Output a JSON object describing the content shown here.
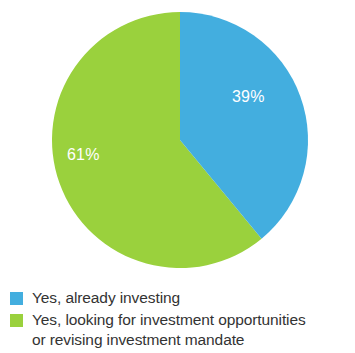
{
  "chart_data": {
    "type": "pie",
    "title": "",
    "subtitle": "",
    "xlabel": "",
    "ylabel": "",
    "grid": false,
    "legend_position": "bottom-left",
    "start_angle_deg": 0,
    "direction": "clockwise",
    "categories": [
      "Yes, already investing",
      "Yes, looking for investment opportunities or revising investment mandate"
    ],
    "values": [
      39,
      61
    ],
    "value_unit": "%",
    "data_labels": [
      "39%",
      "61%"
    ],
    "colors": [
      "#43aedf",
      "#9ad13d"
    ],
    "slices": [
      {
        "label": "Yes, already investing",
        "value": 39,
        "display": "39%",
        "color": "#43aedf",
        "start_deg": 0,
        "end_deg": 140.4
      },
      {
        "label": "Yes, looking for investment opportunities or revising investment mandate",
        "value": 61,
        "display": "61%",
        "color": "#9ad13d",
        "start_deg": 140.4,
        "end_deg": 360
      }
    ]
  },
  "pie": {
    "blue_label": "39%",
    "green_label": "61%"
  },
  "legend": {
    "items": [
      {
        "swatch_color": "#43aedf",
        "line1": "Yes, already investing",
        "line2": ""
      },
      {
        "swatch_color": "#9ad13d",
        "line1": "Yes, looking for investment opportunities",
        "line2": "or revising investment mandate"
      }
    ]
  },
  "palette": {
    "blue": "#43aedf",
    "green": "#9ad13d",
    "label_text": "#ffffff",
    "legend_text": "#333333",
    "background": "#ffffff"
  }
}
